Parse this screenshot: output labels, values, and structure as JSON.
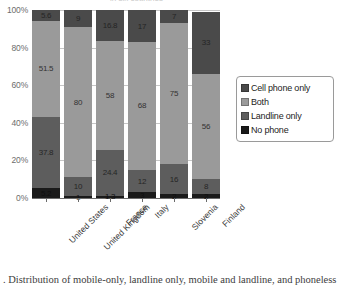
{
  "figure": {
    "title_clipped": "in six countries",
    "caption": ". Distribution of mobile-only, landline only, mobile and landline, and phoneless"
  },
  "legend": {
    "position": "right",
    "items": [
      {
        "label": "Cell phone only",
        "color": "#4a4a4a",
        "swatch_name": "legend-swatch-cell-phone-only"
      },
      {
        "label": "Both",
        "color": "#9a9a9a",
        "swatch_name": "legend-swatch-both"
      },
      {
        "label": "Landline only",
        "color": "#5d5d5d",
        "swatch_name": "legend-swatch-landline-only"
      },
      {
        "label": "No phone",
        "color": "#1a1a1a",
        "swatch_name": "legend-swatch-no-phone"
      }
    ]
  },
  "chart_data": {
    "type": "bar",
    "subtype": "stacked-100-percent",
    "title": "",
    "xlabel": "",
    "ylabel": "",
    "ylim": [
      0,
      100
    ],
    "ytick_labels": [
      "0%",
      "20%",
      "40%",
      "60%",
      "80%",
      "100%"
    ],
    "ytick_values": [
      0,
      20,
      40,
      60,
      80,
      100
    ],
    "grid": true,
    "legend_position": "right",
    "categories": [
      "United States",
      "United Kingdom",
      "France",
      "Italy",
      "Slovenia",
      "Finland"
    ],
    "stack_order_bottom_to_top": [
      "No phone",
      "Landline only",
      "Both",
      "Cell phone only"
    ],
    "series": [
      {
        "name": "No phone",
        "color": "#1a1a1a",
        "values": [
          5.2,
          1,
          1.3,
          3,
          2,
          2
        ],
        "labels": [
          "5.2",
          "1",
          "1.3",
          "3",
          "2",
          "2"
        ]
      },
      {
        "name": "Landline only",
        "color": "#5d5d5d",
        "values": [
          37.8,
          10,
          24.4,
          12,
          16,
          8
        ],
        "labels": [
          "37.8",
          "10",
          "24.4",
          "12",
          "16",
          "8"
        ]
      },
      {
        "name": "Both",
        "color": "#9a9a9a",
        "values": [
          51.5,
          80,
          58,
          68,
          75,
          56
        ],
        "labels": [
          "51.5",
          "80",
          "58",
          "68",
          "75",
          "56"
        ]
      },
      {
        "name": "Cell phone only",
        "color": "#4a4a4a",
        "values": [
          5.6,
          9,
          16.8,
          17,
          7,
          33
        ],
        "labels": [
          "5.6",
          "9",
          "16.8",
          "17",
          "7",
          "33"
        ]
      }
    ]
  }
}
